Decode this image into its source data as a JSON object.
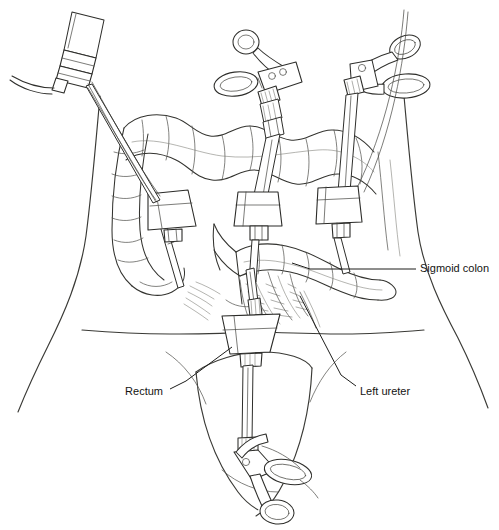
{
  "figure": {
    "style": "black-and-white medical line illustration",
    "background_color": "#ffffff",
    "line_color": "#33332f",
    "label_color": "#141412"
  },
  "labels": [
    {
      "id": "sigmoid-colon",
      "text": "Sigmoid colon",
      "align": "left",
      "text_x": 420,
      "text_y": 269,
      "leader": "M 416 269 L 379 269 L 310 269 L 292 263"
    },
    {
      "id": "rectum",
      "text": "Rectum",
      "align": "right",
      "text_x": 163,
      "text_y": 392,
      "leader": "M 170 389 L 186 381 L 232 347"
    },
    {
      "id": "left-ureter",
      "text": "Left ureter",
      "align": "left",
      "text_x": 360,
      "text_y": 392,
      "leader": "M 356 386 L 341 375 L 300 296"
    }
  ],
  "anatomy": {
    "parts": [
      "abdominal wall outline",
      "transverse colon",
      "descending colon",
      "sigmoid colon",
      "rectum",
      "sigmoid mesentery",
      "left ureter",
      "pelvic brim"
    ]
  },
  "instruments": [
    {
      "id": "laparoscope",
      "name": "laparoscope with light cable",
      "position": "upper-left",
      "handle": "camera head"
    },
    {
      "id": "grasper-mid",
      "name": "ring-handled laparoscopic grasper",
      "position": "upper-middle",
      "handle": "double ring"
    },
    {
      "id": "grasper-right",
      "name": "ring-handled laparoscopic grasper",
      "position": "upper-right",
      "handle": "double ring"
    },
    {
      "id": "grasper-pelvic",
      "name": "ring-handled laparoscopic instrument",
      "position": "lower-middle",
      "handle": "double ring"
    }
  ],
  "ports": [
    {
      "id": "port-left",
      "name": "left lower quadrant trocar",
      "x": 168,
      "y": 212
    },
    {
      "id": "port-mid",
      "name": "periumbilical trocar",
      "x": 256,
      "y": 210
    },
    {
      "id": "port-right",
      "name": "right lower quadrant trocar",
      "x": 338,
      "y": 208
    },
    {
      "id": "port-pelvic",
      "name": "suprapubic trocar",
      "x": 251,
      "y": 335
    }
  ]
}
